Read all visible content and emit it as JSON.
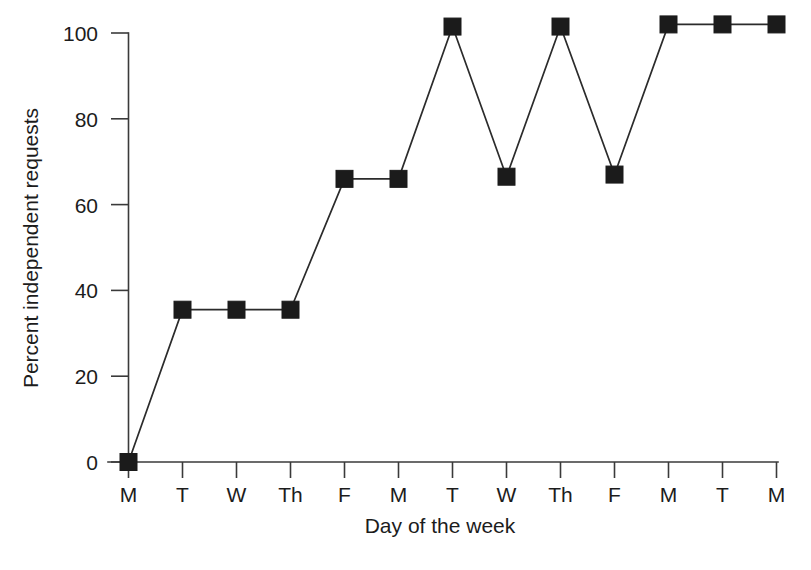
{
  "chart_data": {
    "type": "line",
    "title": "",
    "subtitle": "",
    "xlabel": "Day of the week",
    "ylabel": "Percent independent requests",
    "categories": [
      "M",
      "T",
      "W",
      "Th",
      "F",
      "M",
      "T",
      "W",
      "Th",
      "F",
      "M",
      "T",
      "M"
    ],
    "values": [
      0,
      35.5,
      35.5,
      35.5,
      66,
      66,
      101.5,
      66.5,
      101.5,
      67,
      102,
      102,
      102
    ],
    "series": [
      {
        "name": "Percent independent requests",
        "values": [
          0,
          35.5,
          35.5,
          35.5,
          66,
          66,
          101.5,
          66.5,
          101.5,
          67,
          102,
          102,
          102
        ]
      }
    ],
    "ytick_labels": [
      "0",
      "20",
      "40",
      "60",
      "80",
      "100"
    ],
    "ytick_values": [
      0,
      20,
      40,
      60,
      80,
      100
    ],
    "ylim": [
      0,
      104
    ],
    "xlim": [
      0,
      12
    ],
    "grid": false,
    "legend": false,
    "legend_position": "none",
    "marker": "filled-square",
    "marker_color": "#1b1b1b",
    "line_color": "#2b2b2b",
    "background_color": "#ffffff",
    "axis_color": "#3a3a3a"
  },
  "axis": {
    "y_title": "Percent independent requests",
    "x_title": "Day of the week",
    "y_ticks": [
      "0",
      "20",
      "40",
      "60",
      "80",
      "100"
    ],
    "x_ticks": [
      "M",
      "T",
      "W",
      "Th",
      "F",
      "M",
      "T",
      "W",
      "Th",
      "F",
      "M",
      "T",
      "M"
    ]
  }
}
